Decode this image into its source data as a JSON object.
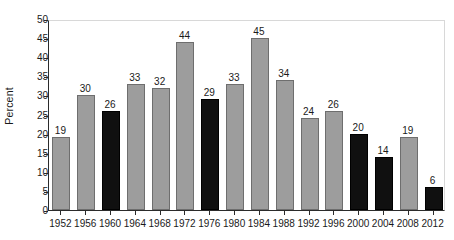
{
  "chart_data": {
    "type": "bar",
    "title": "",
    "subtitle": "",
    "xlabel": "",
    "ylabel": "Percent",
    "categories": [
      "1952",
      "1956",
      "1960",
      "1964",
      "1968",
      "1972",
      "1976",
      "1980",
      "1984",
      "1988",
      "1992",
      "1996",
      "2000",
      "2004",
      "2008",
      "2012"
    ],
    "values": [
      19,
      30,
      26,
      33,
      32,
      44,
      29,
      33,
      45,
      34,
      24,
      26,
      20,
      14,
      19,
      6
    ],
    "bar_colors": [
      "gray",
      "gray",
      "black",
      "gray",
      "gray",
      "gray",
      "black",
      "gray",
      "gray",
      "gray",
      "gray",
      "gray",
      "black",
      "black",
      "gray",
      "black"
    ],
    "data_labels": [
      "19",
      "30",
      "26",
      "33",
      "32",
      "44",
      "29",
      "33",
      "45",
      "34",
      "24",
      "26",
      "20",
      "14",
      "19",
      "6"
    ],
    "ylim": [
      0,
      50
    ],
    "yticks": [
      0,
      5,
      10,
      15,
      20,
      25,
      30,
      35,
      40,
      45,
      50
    ],
    "ytick_labels": [
      "0",
      "5",
      "10",
      "15",
      "20",
      "25",
      "30",
      "35",
      "40",
      "45",
      "50"
    ],
    "grid": false,
    "legend": null,
    "legend_position": "none",
    "colors": {
      "gray_bar": "#9d9d9d",
      "black_bar": "#101010",
      "axis": "#2b2b2b",
      "frame": "#d8d8d8",
      "text": "#1a1a1a",
      "background": "#ffffff"
    }
  }
}
